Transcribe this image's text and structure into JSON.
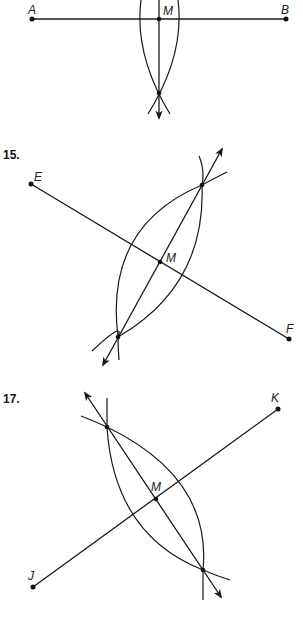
{
  "colors": {
    "ink": "#1a1a1a",
    "background": "#ffffff"
  },
  "problems": [
    {
      "number": "",
      "segment": {
        "p1": {
          "label": "A",
          "x": 32,
          "y": 19
        },
        "p2": {
          "label": "B",
          "x": 286,
          "y": 19
        }
      },
      "midpoint": {
        "label": "M",
        "x": 159,
        "y": 19
      },
      "bisector": {
        "from": {
          "x": 159,
          "y": 0
        },
        "to": {
          "x": 159,
          "y": 118
        },
        "arrow_end": "to"
      },
      "intersections": [
        {
          "x": 159,
          "y": 93
        }
      ],
      "arcs": [
        "M 141 0 Q 134 55 170 114",
        "M 178 0 Q 185 55 148 114"
      ]
    },
    {
      "number": "15.",
      "segment": {
        "p1": {
          "label": "E",
          "x": 31,
          "y": 184
        },
        "p2": {
          "label": "F",
          "x": 289,
          "y": 339
        }
      },
      "midpoint": {
        "label": "M",
        "x": 160,
        "y": 262
      },
      "bisector": {
        "from": {
          "x": 103,
          "y": 365
        },
        "to": {
          "x": 222,
          "y": 149
        },
        "arrow_end": "both"
      },
      "intersections": [
        {
          "x": 202,
          "y": 185
        },
        {
          "x": 118,
          "y": 337
        }
      ],
      "arcs": [
        "M 92 351 Q 125 320 118 337 Q 104 226 202 185 Q 215 178 227 172",
        "M 199 156 Q 205 170 202 185 Q 206 286 118 337 Q 118 348 119 360"
      ]
    },
    {
      "number": "17.",
      "segment": {
        "p1": {
          "label": "J",
          "x": 33,
          "y": 587
        },
        "p2": {
          "label": "K",
          "x": 278,
          "y": 409
        }
      },
      "midpoint": {
        "label": "M",
        "x": 156,
        "y": 499
      },
      "bisector": {
        "from": {
          "x": 85,
          "y": 393
        },
        "to": {
          "x": 221,
          "y": 597
        },
        "arrow_end": "both"
      },
      "intersections": [
        {
          "x": 107,
          "y": 427
        },
        {
          "x": 203,
          "y": 570
        }
      ],
      "arcs": [
        "M 81 416 Q 94 421 107 427 Q 212 478 203 570 Q 203 585 203 600",
        "M 107 398 Q 107 412 107 427 Q 114 535 203 570 Q 217 576 230 580"
      ]
    }
  ]
}
